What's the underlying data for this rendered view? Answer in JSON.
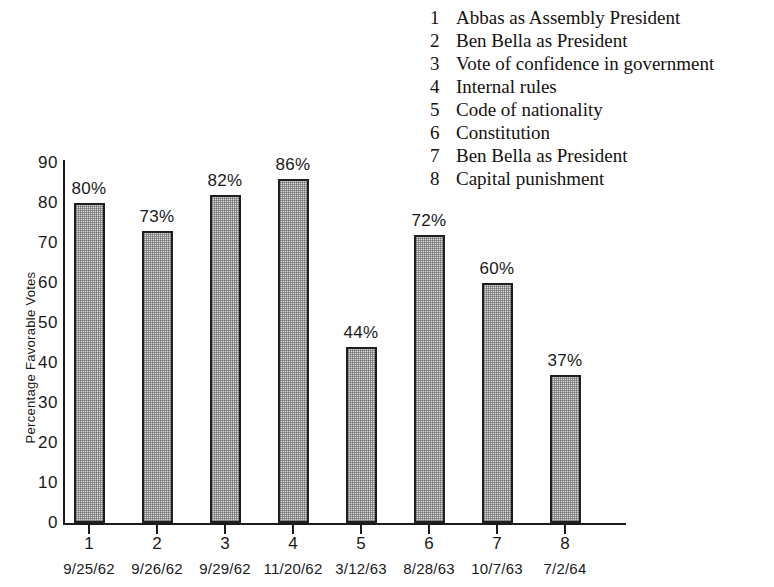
{
  "chart_data": {
    "type": "bar",
    "title": "",
    "xlabel": "",
    "ylabel": "Percentage Favorable Votes",
    "ylim": [
      0,
      90
    ],
    "ytick_labels": [
      "90",
      "80",
      "70",
      "60",
      "50",
      "40",
      "30",
      "20",
      "10",
      "0"
    ],
    "ytick_values": [
      90,
      80,
      70,
      60,
      50,
      40,
      30,
      20,
      10,
      0
    ],
    "grid": false,
    "legend_position": "top-right",
    "categories": [
      "1",
      "2",
      "3",
      "4",
      "5",
      "6",
      "7",
      "8"
    ],
    "values": [
      80,
      73,
      82,
      86,
      44,
      72,
      60,
      37
    ],
    "value_labels": [
      "80%",
      "73%",
      "82%",
      "86%",
      "44%",
      "72%",
      "60%",
      "37%"
    ],
    "dates": [
      "9/25/62",
      "9/26/62",
      "9/29/62",
      "11/20/62",
      "3/12/63",
      "8/28/63",
      "10/7/63",
      "7/2/64"
    ],
    "legend": [
      {
        "num": "1",
        "label": "Abbas as Assembly President"
      },
      {
        "num": "2",
        "label": "Ben Bella as President"
      },
      {
        "num": "3",
        "label": "Vote of confidence in government"
      },
      {
        "num": "4",
        "label": "Internal rules"
      },
      {
        "num": "5",
        "label": "Code of nationality"
      },
      {
        "num": "6",
        "label": "Constitution"
      },
      {
        "num": "7",
        "label": "Ben Bella as President"
      },
      {
        "num": "8",
        "label": "Capital punishment"
      }
    ],
    "colors": {
      "bar_fill": "#dcdcdc",
      "bar_border": "#1f1f1f",
      "axis": "#1a1a1a",
      "text": "#1a1a1a",
      "background": "#ffffff"
    }
  }
}
